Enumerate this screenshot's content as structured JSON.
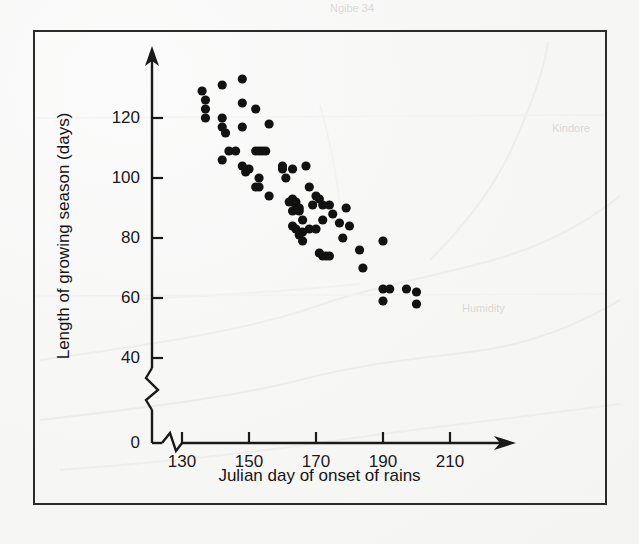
{
  "figure": {
    "x_axis_title": "Julian day of onset of rains",
    "y_axis_title": "Length of growing season (days)",
    "frame_color": "#2b2b2b",
    "point_color": "#121212",
    "background_color": "#f6f6f5"
  },
  "chart_data": {
    "type": "scatter",
    "title": "",
    "xlabel": "Julian day of onset of rains",
    "ylabel": "Length of growing season (days)",
    "xlim": [
      125,
      218
    ],
    "ylim": [
      0,
      137
    ],
    "xticks": [
      130,
      150,
      170,
      190,
      210
    ],
    "yticks": [
      0,
      40,
      60,
      80,
      100,
      120
    ],
    "xtick_labels": [
      "130",
      "150",
      "170",
      "190",
      "210"
    ],
    "ytick_labels": [
      "0",
      "40",
      "60",
      "80",
      "100",
      "120"
    ],
    "axis_break_x": true,
    "axis_break_y": true,
    "grid": false,
    "legend": null,
    "marker": "filled-circle",
    "points": [
      [
        136,
        129
      ],
      [
        137,
        126
      ],
      [
        137,
        123
      ],
      [
        137,
        120
      ],
      [
        142,
        131
      ],
      [
        142,
        120
      ],
      [
        142,
        117
      ],
      [
        143,
        115
      ],
      [
        148,
        133
      ],
      [
        148,
        125
      ],
      [
        148,
        117
      ],
      [
        152,
        123
      ],
      [
        156,
        118
      ],
      [
        142,
        106
      ],
      [
        144,
        109
      ],
      [
        146,
        109
      ],
      [
        152,
        109
      ],
      [
        153,
        109
      ],
      [
        154,
        109
      ],
      [
        155,
        109
      ],
      [
        148,
        104
      ],
      [
        149,
        102
      ],
      [
        150,
        103
      ],
      [
        153,
        100
      ],
      [
        152,
        97
      ],
      [
        153,
        97
      ],
      [
        156,
        94
      ],
      [
        160,
        104
      ],
      [
        160,
        103
      ],
      [
        161,
        100
      ],
      [
        163,
        103
      ],
      [
        167,
        104
      ],
      [
        162,
        92
      ],
      [
        163,
        93
      ],
      [
        164,
        92
      ],
      [
        164,
        91
      ],
      [
        165,
        90
      ],
      [
        163,
        89
      ],
      [
        165,
        89
      ],
      [
        168,
        97
      ],
      [
        170,
        94
      ],
      [
        171,
        93
      ],
      [
        169,
        91
      ],
      [
        172,
        91
      ],
      [
        174,
        91
      ],
      [
        163,
        84
      ],
      [
        164,
        83
      ],
      [
        166,
        86
      ],
      [
        166,
        82
      ],
      [
        168,
        83
      ],
      [
        170,
        83
      ],
      [
        165,
        81
      ],
      [
        166,
        79
      ],
      [
        172,
        86
      ],
      [
        175,
        88
      ],
      [
        177,
        85
      ],
      [
        171,
        75
      ],
      [
        172,
        74
      ],
      [
        173,
        74
      ],
      [
        174,
        74
      ],
      [
        179,
        90
      ],
      [
        180,
        84
      ],
      [
        178,
        80
      ],
      [
        183,
        76
      ],
      [
        190,
        79
      ],
      [
        184,
        70
      ],
      [
        190,
        63
      ],
      [
        192,
        63
      ],
      [
        197,
        63
      ],
      [
        200,
        62
      ],
      [
        190,
        59
      ],
      [
        200,
        58
      ]
    ]
  },
  "smudges": [
    {
      "text": "Ngibe 34",
      "left": 340,
      "top": 4
    },
    {
      "text": "Kindore",
      "left": 560,
      "top": 120
    },
    {
      "text": "Humidity",
      "left": 470,
      "top": 300
    }
  ]
}
